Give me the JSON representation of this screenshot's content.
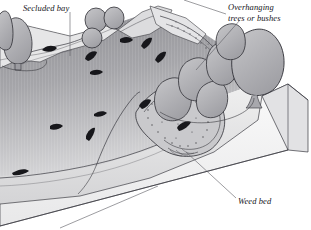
{
  "figure": {
    "kind": "cutaway-block-diagram",
    "background_color": "#ffffff",
    "ink_color": "#2b2b30",
    "water_color": "#9a9a9e",
    "bank_color": "#e9e9ea",
    "foliage_color": "#b4b4b8",
    "block_face_color": "#f2f2f2"
  },
  "labels": {
    "secluded_bay": "Secluded bay",
    "overhanging_line1": "Overhanging",
    "overhanging_line2": "trees or bushes",
    "weed_bed": "Weed bed"
  },
  "features": {
    "fish_count": 12,
    "tree_count": 11,
    "weed_bed_stipple": true
  }
}
